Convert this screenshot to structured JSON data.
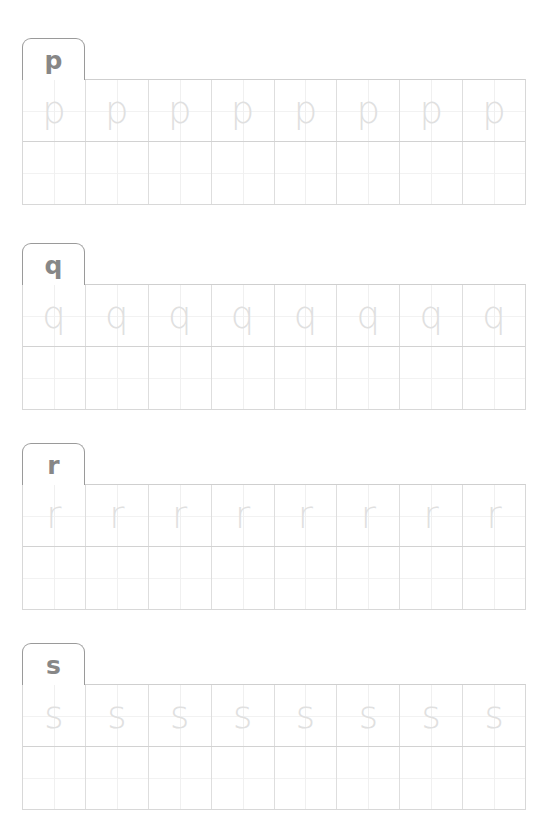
{
  "worksheet": {
    "type": "letter-tracing-worksheet",
    "background_color": "#ffffff",
    "tab_border_color": "#9a9a9a",
    "tab_letter_color": "#878787",
    "grid_border_color": "#d8d8d8",
    "grid_midline_color": "#f0f0f0",
    "trace_letter_color": "#e0e0e0",
    "columns_per_row": 8,
    "rows_per_block": 2,
    "blocks": [
      {
        "tab_label": "p",
        "trace_letters": [
          "p",
          "p",
          "p",
          "p",
          "p",
          "p",
          "p",
          "p"
        ],
        "practice_letters": [
          "",
          "",
          "",
          "",
          "",
          "",
          "",
          ""
        ]
      },
      {
        "tab_label": "q",
        "trace_letters": [
          "q",
          "q",
          "q",
          "q",
          "q",
          "q",
          "q",
          "q"
        ],
        "practice_letters": [
          "",
          "",
          "",
          "",
          "",
          "",
          "",
          ""
        ]
      },
      {
        "tab_label": "r",
        "trace_letters": [
          "r",
          "r",
          "r",
          "r",
          "r",
          "r",
          "r",
          "r"
        ],
        "practice_letters": [
          "",
          "",
          "",
          "",
          "",
          "",
          "",
          ""
        ]
      },
      {
        "tab_label": "s",
        "trace_letters": [
          "s",
          "s",
          "s",
          "s",
          "s",
          "s",
          "s",
          "s"
        ],
        "practice_letters": [
          "",
          "",
          "",
          "",
          "",
          "",
          "",
          ""
        ]
      }
    ]
  }
}
